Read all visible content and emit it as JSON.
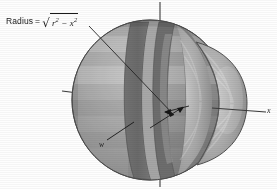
{
  "figure": {
    "background_color": "#fefefe",
    "labels": {
      "radius_prefix": "Radius",
      "equals": "=",
      "sqrt_glyph": "√",
      "radicand_r": "r",
      "radicand_exp_r": "2",
      "minus": "−",
      "radicand_x": "x",
      "radicand_exp_x": "2",
      "radius_full_text": "Radius = √(r² − x²)",
      "slab_width": "w",
      "axis_x": "x"
    },
    "colors": {
      "sphere_dark": "#787878",
      "sphere_mid": "#8c8c8c",
      "sphere_light": "#a8a8a8",
      "sphere_highlight": "#bdbdbd",
      "slab_face": "#6e6e6e",
      "slab_band_light": "#a5a5a5",
      "cap_light": "#c2c2c2",
      "cap_mid": "#9e9e9e",
      "cap_dark": "#7a7a7a",
      "outline": "#4a4a4a",
      "axis": "#3b3b3b",
      "leader": "#242424",
      "text": "#1a1a1a"
    },
    "axes": [
      {
        "name": "vertical-axis",
        "label": ""
      },
      {
        "name": "x-axis",
        "label": "x"
      },
      {
        "name": "y-axis-stub",
        "label": ""
      }
    ],
    "annotations": [
      {
        "name": "radius-leader-line",
        "from": "Radius label",
        "to": "slab face point"
      },
      {
        "name": "width-leader-line",
        "from": "w label",
        "to": "slab near edge"
      },
      {
        "name": "slab-width-arrows",
        "from": "slab left face",
        "to": "slab right face"
      }
    ]
  }
}
